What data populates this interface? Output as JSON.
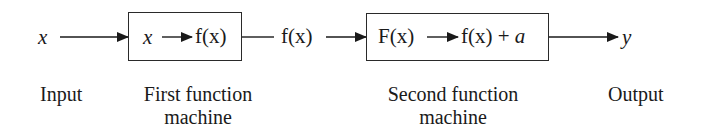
{
  "diagram": {
    "input_symbol": "x",
    "output_symbol": "y",
    "intermediate_symbol": "f(x)",
    "first_machine": {
      "rule_in": "x",
      "rule_out": "f(x)",
      "label_line1": "First function",
      "label_line2": "machine"
    },
    "second_machine": {
      "rule_in": "F(x)",
      "rule_out_fn": "f(x) + ",
      "rule_out_const": "a",
      "label_line1": "Second function",
      "label_line2": "machine"
    },
    "labels": {
      "input": "Input",
      "output": "Output"
    },
    "colors": {
      "ink": "#1a1a1a",
      "background": "#ffffff"
    }
  }
}
